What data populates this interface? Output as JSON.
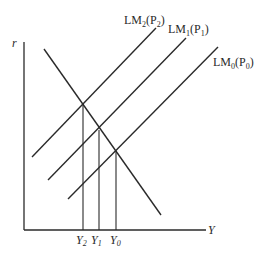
{
  "diagram": {
    "axes": {
      "y_label": "r",
      "x_label": "Y"
    },
    "curves": [
      {
        "id": "IS",
        "label": "",
        "x1": 44,
        "y1": 49,
        "x2": 161,
        "y2": 215
      },
      {
        "id": "LM2",
        "label_main": "LM",
        "label_sub": "2",
        "label_arg": "(P",
        "label_arg_sub": "2",
        "label_close": ")",
        "x1": 32,
        "y1": 157,
        "x2": 156,
        "y2": 28
      },
      {
        "id": "LM1",
        "label_main": "LM",
        "label_sub": "1",
        "label_arg": "(P",
        "label_arg_sub": "1",
        "label_close": ")",
        "x1": 48,
        "y1": 180,
        "x2": 186,
        "y2": 38
      },
      {
        "id": "LM0",
        "label_main": "LM",
        "label_sub": "0",
        "label_arg": "(P",
        "label_arg_sub": "0",
        "label_close": ")",
        "x1": 68,
        "y1": 199,
        "x2": 218,
        "y2": 47
      }
    ],
    "equilibria": [
      {
        "label": "Y",
        "sub": "2",
        "x": 83,
        "y": 104
      },
      {
        "label": "Y",
        "sub": "1",
        "x": 99,
        "y": 130
      },
      {
        "label": "Y",
        "sub": "0",
        "x": 116,
        "y": 151
      }
    ]
  }
}
